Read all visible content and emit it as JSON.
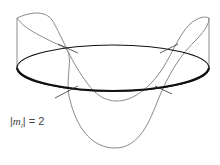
{
  "diagram": {
    "label": {
      "prefix": "|",
      "variable": "m",
      "subscript": "l",
      "suffix": "| = 2"
    },
    "colors": {
      "ring": "#111111",
      "wave": "#8a8a8a",
      "text": "#444444"
    }
  }
}
